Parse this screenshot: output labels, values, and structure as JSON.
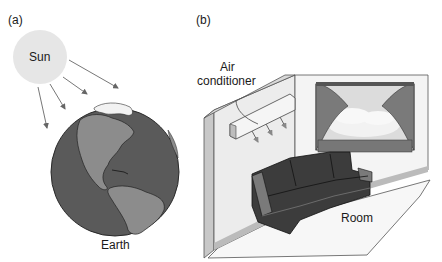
{
  "panel_a": {
    "label": "(a)",
    "sun_label": "Sun",
    "earth_label": "Earth"
  },
  "panel_b": {
    "label": "(b)",
    "ac_label_line1": "Air",
    "ac_label_line2": "conditioner",
    "room_label": "Room"
  },
  "colors": {
    "sun": "#e6e6e6",
    "ocean": "#5a5a5a",
    "land": "#8c8c8c",
    "ice": "#f2f2f2",
    "wall": "#ececec",
    "sofa": "#3c3c3c"
  }
}
